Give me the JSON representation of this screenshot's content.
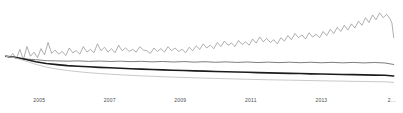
{
  "chart_data": {
    "type": "line",
    "title": "",
    "subtitle": "",
    "xlabel": "",
    "ylabel": "",
    "grid": false,
    "legend_position": "none",
    "xlim": [
      2004.0,
      2015.2
    ],
    "ylim": [
      0.0,
      1.25
    ],
    "x_tick_labels": [
      "2005",
      "2007",
      "2009",
      "2011",
      "2013",
      "2…"
    ],
    "x_tick_values": [
      2005,
      2007,
      2009,
      2011,
      2013,
      2015
    ],
    "series": [
      {
        "name": "series-volatile-growth",
        "color": "#8c8c8c",
        "width": 0.7,
        "x": [
          2004.05,
          2004.15,
          2004.25,
          2004.35,
          2004.45,
          2004.55,
          2004.65,
          2004.75,
          2004.85,
          2004.95,
          2005.05,
          2005.15,
          2005.25,
          2005.35,
          2005.45,
          2005.55,
          2005.65,
          2005.75,
          2005.85,
          2005.95,
          2006.05,
          2006.15,
          2006.25,
          2006.35,
          2006.45,
          2006.55,
          2006.65,
          2006.75,
          2006.85,
          2006.95,
          2007.05,
          2007.15,
          2007.25,
          2007.35,
          2007.45,
          2007.55,
          2007.65,
          2007.75,
          2007.85,
          2007.95,
          2008.05,
          2008.15,
          2008.25,
          2008.35,
          2008.45,
          2008.55,
          2008.65,
          2008.75,
          2008.85,
          2008.95,
          2009.05,
          2009.15,
          2009.25,
          2009.35,
          2009.45,
          2009.55,
          2009.65,
          2009.75,
          2009.85,
          2009.95,
          2010.05,
          2010.15,
          2010.25,
          2010.35,
          2010.45,
          2010.55,
          2010.65,
          2010.75,
          2010.85,
          2010.95,
          2011.05,
          2011.15,
          2011.25,
          2011.35,
          2011.45,
          2011.55,
          2011.65,
          2011.75,
          2011.85,
          2011.95,
          2012.05,
          2012.15,
          2012.25,
          2012.35,
          2012.45,
          2012.55,
          2012.65,
          2012.75,
          2012.85,
          2012.95,
          2013.05,
          2013.15,
          2013.25,
          2013.35,
          2013.45,
          2013.55,
          2013.65,
          2013.75,
          2013.85,
          2013.95,
          2014.05,
          2014.15,
          2014.25,
          2014.35,
          2014.45,
          2014.55,
          2014.65,
          2014.75,
          2014.85,
          2014.95,
          2015.0,
          2015.05
        ],
        "y": [
          0.52,
          0.5,
          0.56,
          0.48,
          0.62,
          0.47,
          0.66,
          0.52,
          0.58,
          0.5,
          0.63,
          0.54,
          0.72,
          0.56,
          0.61,
          0.55,
          0.59,
          0.53,
          0.64,
          0.57,
          0.6,
          0.55,
          0.66,
          0.58,
          0.62,
          0.57,
          0.7,
          0.6,
          0.65,
          0.58,
          0.63,
          0.57,
          0.68,
          0.6,
          0.64,
          0.59,
          0.62,
          0.58,
          0.66,
          0.61,
          0.6,
          0.56,
          0.64,
          0.59,
          0.63,
          0.58,
          0.66,
          0.6,
          0.64,
          0.59,
          0.62,
          0.57,
          0.65,
          0.6,
          0.67,
          0.62,
          0.7,
          0.64,
          0.68,
          0.63,
          0.72,
          0.66,
          0.74,
          0.68,
          0.71,
          0.66,
          0.75,
          0.69,
          0.73,
          0.68,
          0.77,
          0.71,
          0.8,
          0.73,
          0.78,
          0.72,
          0.76,
          0.7,
          0.79,
          0.74,
          0.82,
          0.76,
          0.85,
          0.79,
          0.83,
          0.77,
          0.86,
          0.8,
          0.84,
          0.79,
          0.88,
          0.82,
          0.91,
          0.85,
          0.94,
          0.88,
          0.97,
          0.9,
          0.99,
          0.93,
          1.03,
          0.97,
          1.08,
          1.01,
          1.12,
          1.05,
          1.15,
          1.08,
          1.13,
          1.06,
          1.0,
          0.79
        ]
      },
      {
        "name": "series-flat-gray",
        "color": "#6e6e6e",
        "width": 0.9,
        "x": [
          2004.05,
          2004.3,
          2004.6,
          2004.9,
          2005.2,
          2005.5,
          2005.8,
          2006.1,
          2006.4,
          2006.7,
          2007.0,
          2007.3,
          2007.6,
          2007.9,
          2008.2,
          2008.5,
          2008.8,
          2009.1,
          2009.4,
          2009.7,
          2010.0,
          2010.3,
          2010.6,
          2010.9,
          2011.2,
          2011.5,
          2011.8,
          2012.1,
          2012.4,
          2012.7,
          2013.0,
          2013.3,
          2013.6,
          2013.9,
          2014.2,
          2014.5,
          2014.8,
          2015.05
        ],
        "y": [
          0.52,
          0.5,
          0.48,
          0.47,
          0.455,
          0.452,
          0.448,
          0.452,
          0.445,
          0.45,
          0.444,
          0.448,
          0.441,
          0.446,
          0.438,
          0.444,
          0.436,
          0.442,
          0.434,
          0.44,
          0.432,
          0.438,
          0.43,
          0.436,
          0.428,
          0.434,
          0.427,
          0.433,
          0.426,
          0.432,
          0.425,
          0.431,
          0.424,
          0.43,
          0.423,
          0.429,
          0.422,
          0.4
        ]
      },
      {
        "name": "series-thick-dark-decline",
        "color": "#1c1c1c",
        "width": 1.6,
        "x": [
          2004.05,
          2004.3,
          2004.6,
          2004.9,
          2005.2,
          2005.5,
          2005.8,
          2006.1,
          2006.4,
          2006.7,
          2007.0,
          2007.3,
          2007.6,
          2007.9,
          2008.2,
          2008.5,
          2008.8,
          2009.1,
          2009.4,
          2009.7,
          2010.0,
          2010.3,
          2010.6,
          2010.9,
          2011.2,
          2011.5,
          2011.8,
          2012.1,
          2012.4,
          2012.7,
          2013.0,
          2013.3,
          2013.6,
          2013.9,
          2014.2,
          2014.5,
          2014.8,
          2015.05
        ],
        "y": [
          0.52,
          0.505,
          0.475,
          0.44,
          0.415,
          0.398,
          0.384,
          0.375,
          0.366,
          0.358,
          0.352,
          0.345,
          0.339,
          0.333,
          0.328,
          0.322,
          0.317,
          0.312,
          0.307,
          0.303,
          0.298,
          0.294,
          0.29,
          0.286,
          0.282,
          0.278,
          0.275,
          0.271,
          0.268,
          0.264,
          0.261,
          0.258,
          0.255,
          0.252,
          0.249,
          0.246,
          0.243,
          0.232
        ]
      },
      {
        "name": "series-light-gray-decline",
        "color": "#c2c2c2",
        "width": 0.9,
        "x": [
          2004.05,
          2004.3,
          2004.6,
          2004.9,
          2005.2,
          2005.5,
          2005.8,
          2006.1,
          2006.4,
          2006.7,
          2007.0,
          2007.3,
          2007.6,
          2007.9,
          2008.2,
          2008.5,
          2008.8,
          2009.1,
          2009.4,
          2009.7,
          2010.0,
          2010.3,
          2010.6,
          2010.9,
          2011.2,
          2011.5,
          2011.8,
          2012.1,
          2012.4,
          2012.7,
          2013.0,
          2013.3,
          2013.6,
          2013.9,
          2014.2,
          2014.5,
          2014.8,
          2015.05
        ],
        "y": [
          0.52,
          0.498,
          0.452,
          0.402,
          0.362,
          0.334,
          0.312,
          0.295,
          0.281,
          0.269,
          0.259,
          0.25,
          0.242,
          0.235,
          0.228,
          0.222,
          0.216,
          0.211,
          0.206,
          0.201,
          0.197,
          0.193,
          0.189,
          0.185,
          0.181,
          0.178,
          0.175,
          0.172,
          0.169,
          0.166,
          0.163,
          0.16,
          0.158,
          0.155,
          0.153,
          0.15,
          0.148,
          0.14
        ]
      }
    ]
  }
}
